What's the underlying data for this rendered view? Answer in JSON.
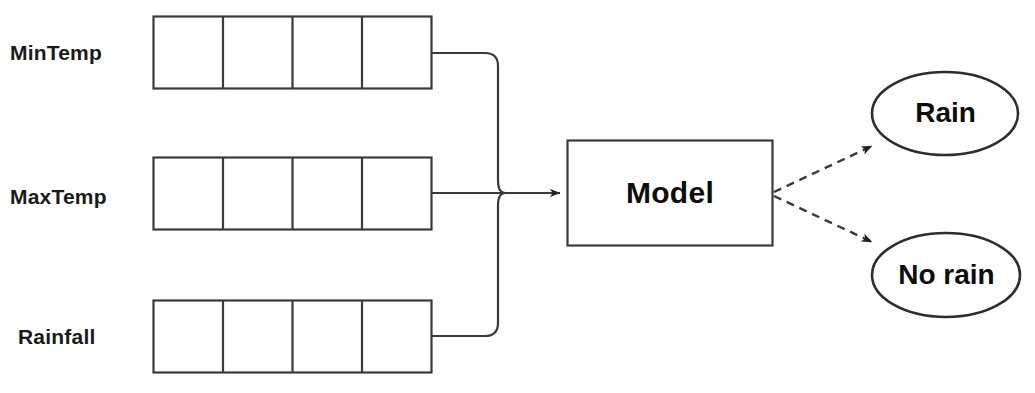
{
  "diagram": {
    "background_color": "#ffffff",
    "stroke_color": "#3a3a3a",
    "text_color": "#1a1a1a",
    "features": [
      {
        "label": "MinTemp",
        "cells": 4,
        "row_index": 0
      },
      {
        "label": "MaxTemp",
        "cells": 4,
        "row_index": 1
      },
      {
        "label": "Rainfall",
        "cells": 4,
        "row_index": 2
      }
    ],
    "process": {
      "label": "Model",
      "shape": "rectangle"
    },
    "outputs": [
      {
        "label": "Rain",
        "shape": "ellipse",
        "position": "top"
      },
      {
        "label": "No rain",
        "shape": "ellipse",
        "position": "bottom"
      }
    ],
    "connectors": {
      "input_style": "solid",
      "output_style": "dashed",
      "arrowhead": "filled-triangle"
    }
  }
}
